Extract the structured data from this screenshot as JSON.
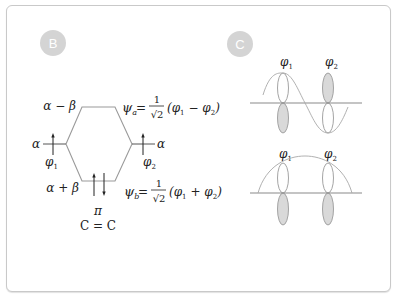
{
  "panels": {
    "b": {
      "badge": "B",
      "level_top": "α − β",
      "level_bottom": "α + β",
      "left_level": "α",
      "right_level": "α",
      "left_orbital": "φ",
      "left_orbital_sub": "1",
      "right_orbital": "φ",
      "right_orbital_sub": "2",
      "psi_a": {
        "symbol": "ψ",
        "sub": "a",
        "eq": "=",
        "num": "1",
        "den": "√2",
        "combo_open": "(φ",
        "combo_sub1": "1",
        "combo_op": " − φ",
        "combo_sub2": "2",
        "combo_close": ")"
      },
      "psi_b": {
        "symbol": "ψ",
        "sub": "b",
        "eq": "=",
        "num": "1",
        "den": "√2",
        "combo_open": "(φ",
        "combo_sub1": "1",
        "combo_op": " + φ",
        "combo_sub2": "2",
        "combo_close": ")"
      },
      "bond_label": "π",
      "bond": "C = C"
    },
    "c": {
      "badge": "C",
      "top": {
        "label1": "φ",
        "sub1": "1",
        "label2": "φ",
        "sub2": "2"
      },
      "bottom": {
        "label1": "φ",
        "sub1": "1",
        "label2": "φ",
        "sub2": "2"
      }
    }
  },
  "colors": {
    "badge_fill": "#d4d4d4",
    "line": "#9a9a9a",
    "lobe_fill": "#d9d9d9",
    "text": "#222222"
  }
}
